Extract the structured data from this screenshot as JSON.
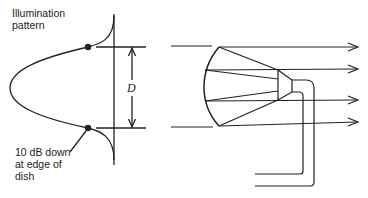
{
  "diagram": {
    "type": "antenna-illumination-diagram",
    "left_panel": {
      "title_label": [
        "Illumination",
        "pattern"
      ],
      "edge_label": [
        "10 dB down",
        "at edge of",
        "dish"
      ],
      "dimension_label": "D"
    },
    "right_panel": {
      "components": [
        "parabolic-dish",
        "feed-horn",
        "waveguide",
        "outgoing-rays"
      ],
      "ray_count": 4
    },
    "colors": {
      "stroke": "#222222",
      "background": "#ffffff"
    }
  }
}
